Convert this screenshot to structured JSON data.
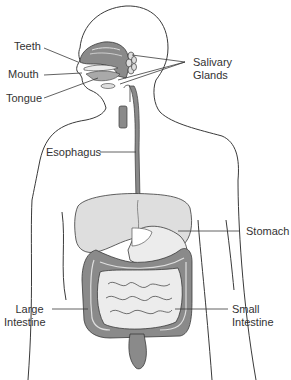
{
  "diagram": {
    "colors": {
      "outline": "#3a3a3a",
      "organ_dark": "#8a8a8a",
      "organ_mid": "#a9a9a9",
      "organ_light": "#dedede",
      "organ_pale": "#ececec",
      "label_text": "#333333",
      "background": "#ffffff"
    },
    "labels": {
      "teeth": "Teeth",
      "mouth": "Mouth",
      "tongue": "Tongue",
      "salivary_line1": "Salivary",
      "salivary_line2": "Glands",
      "esophagus": "Esophagus",
      "stomach": "Stomach",
      "large_intestine_line1": "Large",
      "large_intestine_line2": "Intestine",
      "small_intestine_line1": "Small",
      "small_intestine_line2": "Intestine"
    }
  }
}
